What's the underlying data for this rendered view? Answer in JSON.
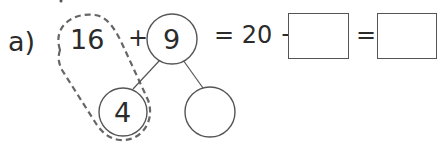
{
  "question": {
    "label": "a)",
    "left_number": "16",
    "plus_sign": "+",
    "top_circle_value": "9",
    "partition_left_value": "4",
    "partition_right_value": "",
    "equals_1": "= 20 +",
    "answer_box_1": "",
    "equals_2": "=",
    "answer_box_2": ""
  },
  "colors": {
    "stroke": "#555555",
    "dashed_stroke": "#666666",
    "text": "#2b2b2b"
  }
}
